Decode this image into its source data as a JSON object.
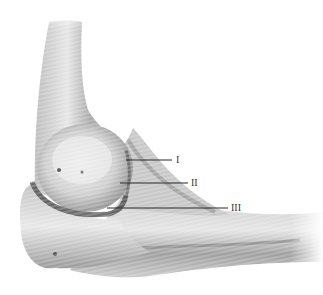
{
  "figure": {
    "labels": [
      {
        "id": "I",
        "text": "I"
      },
      {
        "id": "II",
        "text": "II"
      },
      {
        "id": "III",
        "text": "III"
      }
    ]
  }
}
